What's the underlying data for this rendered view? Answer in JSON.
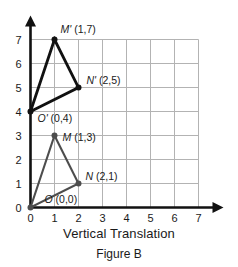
{
  "caption": {
    "title": "Vertical Translation",
    "figure": "Figure B"
  },
  "chart_data": {
    "type": "scatter",
    "title": "Vertical Translation",
    "subtitle": "Figure B",
    "xlabel": "",
    "ylabel": "",
    "xlim": [
      0,
      7
    ],
    "ylim": [
      0,
      7
    ],
    "xticks": [
      "0",
      "1",
      "2",
      "3",
      "4",
      "5",
      "6",
      "7"
    ],
    "yticks": [
      "0",
      "1",
      "2",
      "3",
      "4",
      "5",
      "6",
      "7"
    ],
    "grid": true,
    "legend": "none",
    "axis_arrows": true,
    "colors": {
      "preimage": "#4d4d4d",
      "image": "#111111",
      "grid": "#b3b3b3",
      "axis": "#111111",
      "background": "#ffffff"
    },
    "series": [
      {
        "name": "preimage-triangle",
        "closed": true,
        "points": [
          {
            "id": "O",
            "label": "O (0,0)",
            "letter": "O",
            "coords": "(0,0)",
            "x": 0,
            "y": 0,
            "label_dx": 14,
            "label_dy": -5
          },
          {
            "id": "M",
            "label": "M (1,3)",
            "letter": "M",
            "coords": "(1,3)",
            "x": 1,
            "y": 3,
            "label_dx": 8,
            "label_dy": 5
          },
          {
            "id": "N",
            "label": "N (2,1)",
            "letter": "N",
            "coords": "(2,1)",
            "x": 2,
            "y": 1,
            "label_dx": 7,
            "label_dy": -4
          }
        ]
      },
      {
        "name": "image-triangle",
        "closed": true,
        "points": [
          {
            "id": "O-prime",
            "label": "O' (0,4)",
            "letter": "O'",
            "coords": "(0,4)",
            "x": 0,
            "y": 4,
            "label_dx": 7,
            "label_dy": 10
          },
          {
            "id": "M-prime",
            "label": "M' (1,7)",
            "letter": "M'",
            "coords": "(1,7)",
            "x": 1,
            "y": 7,
            "label_dx": 6,
            "label_dy": -7
          },
          {
            "id": "N-prime",
            "label": "N' (2,5)",
            "letter": "N'",
            "coords": "(2,5)",
            "x": 2,
            "y": 5,
            "label_dx": 8,
            "label_dy": -4
          }
        ]
      }
    ],
    "annotations": [
      {
        "text": "Vertical Translation",
        "role": "axis-caption"
      },
      {
        "text": "Figure B",
        "role": "figure-caption"
      }
    ]
  }
}
